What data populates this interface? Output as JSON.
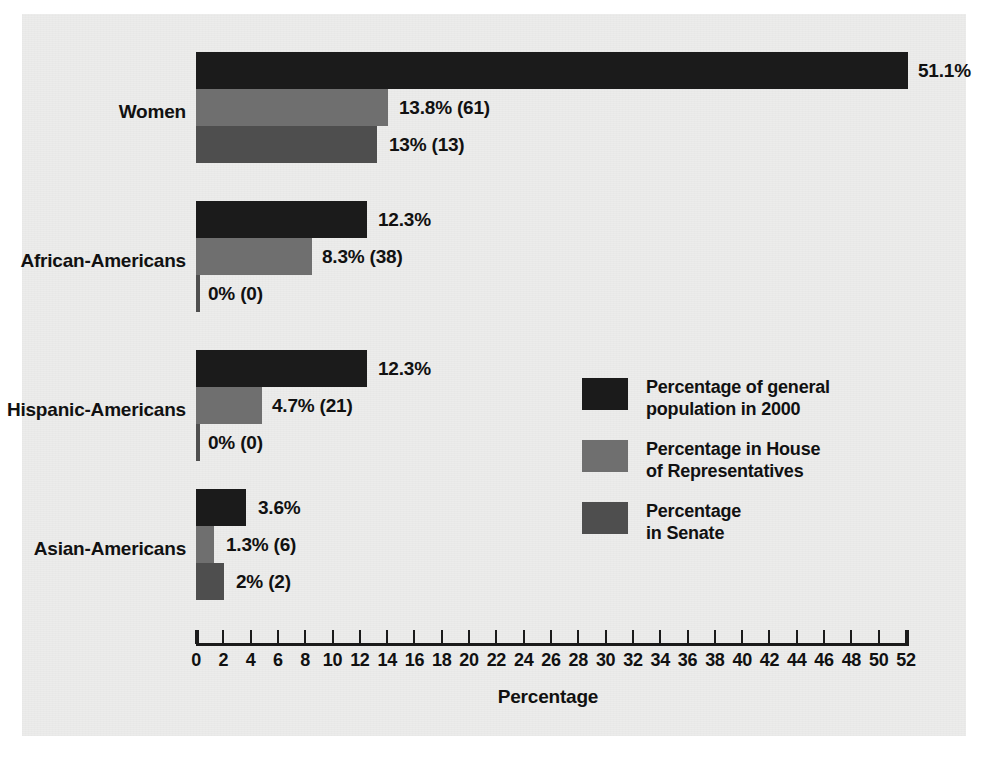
{
  "chart_data": {
    "type": "bar",
    "orientation": "horizontal",
    "title": "",
    "xlabel": "Percentage",
    "ylabel": "",
    "xlim": [
      0,
      52
    ],
    "xticks": [
      0,
      2,
      4,
      6,
      8,
      10,
      12,
      14,
      16,
      18,
      20,
      22,
      24,
      26,
      28,
      30,
      32,
      34,
      36,
      38,
      40,
      42,
      44,
      46,
      48,
      50,
      52
    ],
    "grid": false,
    "legend_position": "center-right",
    "categories": [
      "Women",
      "African-Americans",
      "Hispanic-Americans",
      "Asian-Americans"
    ],
    "series": [
      {
        "name": "Percentage of general population in 2000",
        "values": [
          51.1,
          12.3,
          12.3,
          3.6
        ],
        "labels": [
          "51.1%",
          "12.3%",
          "12.3%",
          "3.6%"
        ],
        "color": "#1b1b1b"
      },
      {
        "name": "Percentage in House of Representatives",
        "values": [
          13.8,
          8.3,
          4.7,
          1.3
        ],
        "counts": [
          61,
          38,
          21,
          6
        ],
        "labels": [
          "13.8% (61)",
          "8.3% (38)",
          "4.7% (21)",
          "1.3% (6)"
        ],
        "color": "#6f6f6f"
      },
      {
        "name": "Percentage in Senate",
        "values": [
          13,
          0,
          0,
          2
        ],
        "counts": [
          13,
          0,
          0,
          2
        ],
        "labels": [
          "13% (13)",
          "0% (0)",
          "0% (0)",
          "2% (2)"
        ],
        "color": "#4e4e4e"
      }
    ]
  },
  "axis": {
    "title": "Percentage",
    "tick_labels": [
      "0",
      "2",
      "4",
      "6",
      "8",
      "10",
      "12",
      "14",
      "16",
      "18",
      "20",
      "22",
      "24",
      "26",
      "28",
      "30",
      "32",
      "34",
      "36",
      "38",
      "40",
      "42",
      "44",
      "46",
      "48",
      "50",
      "52"
    ]
  },
  "categories": [
    {
      "label": "Women"
    },
    {
      "label": "African-Americans"
    },
    {
      "label": "Hispanic-Americans"
    },
    {
      "label": "Asian-Americans"
    }
  ],
  "legend": {
    "items": [
      {
        "lines": [
          "Percentage of general",
          "population in 2000"
        ],
        "color": "#1b1b1b"
      },
      {
        "lines": [
          "Percentage in House",
          "of Representatives"
        ],
        "color": "#6f6f6f"
      },
      {
        "lines": [
          "Percentage",
          "in Senate"
        ],
        "color": "#4e4e4e"
      }
    ]
  },
  "colors": {
    "series_general": "#1b1b1b",
    "series_house": "#6f6f6f",
    "series_senate": "#4e4e4e",
    "paper": "#ececeb",
    "ink": "#111111"
  }
}
